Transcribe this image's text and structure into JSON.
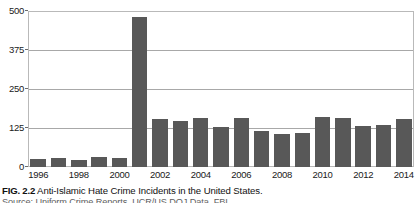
{
  "figure": {
    "number_label": "FIG. 2.2",
    "caption": "Anti-Islamic Hate Crime Incidents in the United States.",
    "source_line": "Source: Uniform Crime Reports, UCR/US DOJ Data, FBI."
  },
  "chart_data": {
    "type": "bar",
    "title": "Anti-Islamic Hate Crime Incidents in the United States",
    "xlabel": "",
    "ylabel": "",
    "ylim": [
      0,
      500
    ],
    "yticks": [
      0,
      125,
      250,
      375,
      500
    ],
    "grid": true,
    "legend": false,
    "bar_color": "#585858",
    "categories": [
      "1996",
      "1997",
      "1998",
      "1999",
      "2000",
      "2001",
      "2002",
      "2003",
      "2004",
      "2005",
      "2006",
      "2007",
      "2008",
      "2009",
      "2010",
      "2011",
      "2012",
      "2013",
      "2014"
    ],
    "visible_tick_labels": [
      "1996",
      "1998",
      "2000",
      "2002",
      "2004",
      "2006",
      "2008",
      "2010",
      "2012",
      "2014"
    ],
    "values": [
      27,
      28,
      21,
      32,
      28,
      481,
      155,
      149,
      156,
      128,
      156,
      115,
      105,
      109,
      160,
      157,
      130,
      135,
      154
    ]
  },
  "colors": {
    "bar": "#585858",
    "gridline": "#a8a8a8",
    "border": "#b9b9b9",
    "background": "#ffffff",
    "text": "#1a1a1a"
  }
}
